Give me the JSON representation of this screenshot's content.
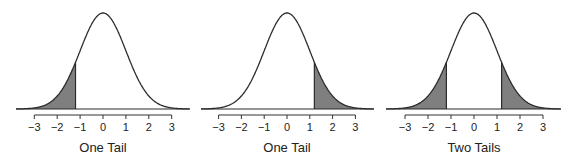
{
  "chart_data": [
    {
      "type": "area",
      "title": "One Tail",
      "xlabel": "One Tail",
      "distribution": "standard normal",
      "x_ticks": [
        -3,
        -2,
        -1,
        0,
        1,
        2,
        3
      ],
      "x_tick_labels": [
        "−3",
        "−2",
        "−1",
        "0",
        "1",
        "2",
        "3"
      ],
      "xlim": [
        -3.8,
        3.8
      ],
      "shaded_regions": [
        {
          "from": -3.8,
          "to": -1.2,
          "side": "left"
        }
      ],
      "cutoffs": [
        -1.2
      ]
    },
    {
      "type": "area",
      "title": "One Tail",
      "xlabel": "One Tail",
      "distribution": "standard normal",
      "x_ticks": [
        -3,
        -2,
        -1,
        0,
        1,
        2,
        3
      ],
      "x_tick_labels": [
        "−3",
        "−2",
        "−1",
        "0",
        "1",
        "2",
        "3"
      ],
      "xlim": [
        -3.8,
        3.8
      ],
      "shaded_regions": [
        {
          "from": 1.2,
          "to": 3.8,
          "side": "right"
        }
      ],
      "cutoffs": [
        1.2
      ]
    },
    {
      "type": "area",
      "title": "Two Tails",
      "xlabel": "Two Tails",
      "distribution": "standard normal",
      "x_ticks": [
        -3,
        -2,
        -1,
        0,
        1,
        2,
        3
      ],
      "x_tick_labels": [
        "−3",
        "−2",
        "−1",
        "0",
        "1",
        "2",
        "3"
      ],
      "xlim": [
        -3.8,
        3.8
      ],
      "shaded_regions": [
        {
          "from": -3.8,
          "to": -1.2,
          "side": "left"
        },
        {
          "from": 1.2,
          "to": 3.8,
          "side": "right"
        }
      ],
      "cutoffs": [
        -1.2,
        1.2
      ]
    }
  ],
  "panels": [
    {
      "label": "One Tail",
      "cx": 103,
      "sd": 22.9,
      "x0": 16,
      "x1": 190,
      "shade": [
        [
          -3.8,
          -1.2
        ]
      ]
    },
    {
      "label": "One Tail",
      "cx": 287,
      "sd": 22.8,
      "x0": 201,
      "x1": 374,
      "shade": [
        [
          1.2,
          3.8
        ]
      ]
    },
    {
      "label": "Two Tails",
      "cx": 474,
      "sd": 23.0,
      "x0": 386,
      "x1": 561,
      "shade": [
        [
          -3.8,
          -1.2
        ],
        [
          1.2,
          3.8
        ]
      ]
    }
  ],
  "colors": {
    "curve": "#2b2b2b",
    "shade": "#7f7f7f",
    "axis": "#333333",
    "background": "#ffffff"
  }
}
